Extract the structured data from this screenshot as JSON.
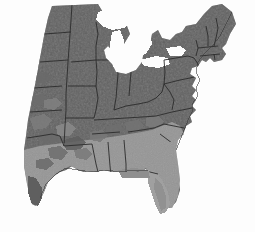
{
  "figure": {
    "title": "Eastern and Central United States raster map",
    "width": 255,
    "height": 232,
    "background_color": "#fdfdfd"
  },
  "chart_data": {
    "type": "heatmap",
    "title": "Eastern and Central United States raster map",
    "subtitle": "",
    "xlabel": "",
    "ylabel": "",
    "grid": false,
    "legend_position": "none",
    "projection": "geographic",
    "colormap": "grayscale",
    "classes": [
      {
        "name": "dark",
        "color": "#595959",
        "description": "Northern and Midwestern states"
      },
      {
        "name": "mid-dark",
        "color": "#6b6b6b",
        "description": "Transition and Appalachian zone"
      },
      {
        "name": "mid",
        "color": "#7d7d7d",
        "description": "Mid-South and mottled patches"
      },
      {
        "name": "light",
        "color": "#8f8f8f",
        "description": "Southeastern Coastal Plain and Gulf Coast"
      },
      {
        "name": "lighter",
        "color": "#a0a0a0",
        "description": "Florida peninsula and outer coast"
      },
      {
        "name": "background",
        "color": "#fdfdfd",
        "description": "Ocean, Gulf, Great Lakes and outside study area"
      }
    ],
    "boundary_color": "#2b2b2b",
    "regions": [
      {
        "name": "North Dakota",
        "class": "dark"
      },
      {
        "name": "South Dakota",
        "class": "dark"
      },
      {
        "name": "Nebraska",
        "class": "mid"
      },
      {
        "name": "Kansas",
        "class": "mid"
      },
      {
        "name": "Oklahoma",
        "class": "mid"
      },
      {
        "name": "Texas",
        "class": "mid"
      },
      {
        "name": "Minnesota",
        "class": "dark"
      },
      {
        "name": "Iowa",
        "class": "dark"
      },
      {
        "name": "Missouri",
        "class": "mid-dark"
      },
      {
        "name": "Arkansas",
        "class": "mid"
      },
      {
        "name": "Louisiana",
        "class": "light"
      },
      {
        "name": "Wisconsin",
        "class": "dark"
      },
      {
        "name": "Illinois",
        "class": "dark"
      },
      {
        "name": "Michigan",
        "class": "dark"
      },
      {
        "name": "Indiana",
        "class": "dark"
      },
      {
        "name": "Ohio",
        "class": "dark"
      },
      {
        "name": "Kentucky",
        "class": "dark"
      },
      {
        "name": "Tennessee",
        "class": "mid-dark"
      },
      {
        "name": "Mississippi",
        "class": "light"
      },
      {
        "name": "Alabama",
        "class": "light"
      },
      {
        "name": "Georgia",
        "class": "light"
      },
      {
        "name": "Florida",
        "class": "lighter"
      },
      {
        "name": "South Carolina",
        "class": "light"
      },
      {
        "name": "North Carolina",
        "class": "light"
      },
      {
        "name": "Virginia",
        "class": "mid-dark"
      },
      {
        "name": "West Virginia",
        "class": "dark"
      },
      {
        "name": "Pennsylvania",
        "class": "dark"
      },
      {
        "name": "New York",
        "class": "dark"
      },
      {
        "name": "Maryland",
        "class": "mid-dark"
      },
      {
        "name": "Delaware",
        "class": "mid-dark"
      },
      {
        "name": "New Jersey",
        "class": "dark"
      },
      {
        "name": "Connecticut",
        "class": "dark"
      },
      {
        "name": "Rhode Island",
        "class": "dark"
      },
      {
        "name": "Massachusetts",
        "class": "dark"
      },
      {
        "name": "Vermont",
        "class": "dark"
      },
      {
        "name": "New Hampshire",
        "class": "dark"
      },
      {
        "name": "Maine",
        "class": "mid"
      }
    ],
    "water_features": [
      {
        "name": "Lake Superior"
      },
      {
        "name": "Lake Michigan"
      },
      {
        "name": "Lake Huron"
      },
      {
        "name": "Lake Erie"
      },
      {
        "name": "Lake Ontario"
      },
      {
        "name": "Atlantic Ocean"
      },
      {
        "name": "Gulf of Mexico"
      }
    ]
  }
}
